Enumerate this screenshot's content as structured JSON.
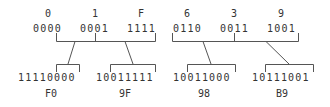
{
  "diagram": {
    "title": "",
    "colors": {
      "text": "#333333",
      "line": "#555555",
      "background": "#ffffff"
    },
    "groups": [
      {
        "name": "group-left",
        "hex_inputs": [
          "0",
          "1",
          "F"
        ],
        "nibbles": [
          "0000",
          "0001",
          "1111"
        ],
        "outputs": [
          {
            "binary": "11110000",
            "hex": "F0"
          },
          {
            "binary": "10011111",
            "hex": "9F"
          }
        ]
      },
      {
        "name": "group-right",
        "hex_inputs": [
          "6",
          "3",
          "9"
        ],
        "nibbles": [
          "0110",
          "0011",
          "1001"
        ],
        "outputs": [
          {
            "binary": "10011000",
            "hex": "98"
          },
          {
            "binary": "10111001",
            "hex": "B9"
          }
        ]
      }
    ]
  }
}
